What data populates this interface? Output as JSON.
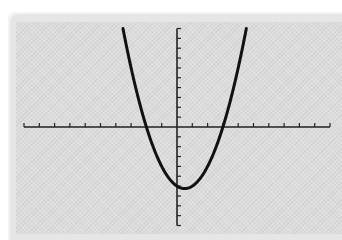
{
  "chart_data": {
    "type": "line",
    "title": "",
    "xlabel": "",
    "ylabel": "",
    "function": "y = x^2 - x - 6",
    "xlim": [
      -10,
      10
    ],
    "ylim": [
      -10,
      10
    ],
    "x_tick_step": 1,
    "y_tick_step": 1,
    "grid": false,
    "legend": null,
    "series": [
      {
        "name": "parabola",
        "x": [
          -3.53,
          -3,
          -2,
          -1,
          0,
          0.5,
          1,
          2,
          3,
          4,
          4.53
        ],
        "y": [
          10,
          6,
          0,
          -4,
          -6,
          -6.25,
          -6,
          -4,
          0,
          6,
          10
        ]
      }
    ],
    "annotations": {
      "vertex": [
        0.5,
        -6.25
      ],
      "x_intercepts": [
        -2,
        3
      ],
      "y_intercept": -6
    },
    "colors": {
      "curve": "#111111",
      "axes": "#222222",
      "screen": "#dcdcdc",
      "frame": "#e6e6e6"
    }
  }
}
